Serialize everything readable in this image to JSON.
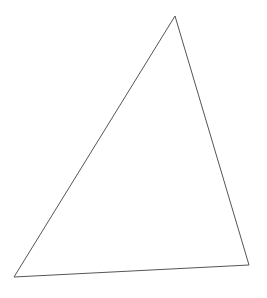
{
  "diagram": {
    "shape": "triangle",
    "stroke_color": "#555555",
    "fill_color": "none",
    "stroke_width": 1,
    "vertices": [
      {
        "x": 175,
        "y": 16
      },
      {
        "x": 249,
        "y": 265
      },
      {
        "x": 14,
        "y": 277
      }
    ]
  }
}
